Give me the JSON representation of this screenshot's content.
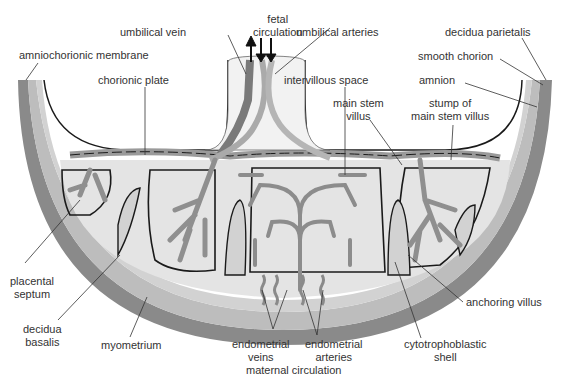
{
  "colors": {
    "myometrium": "#8a8a8a",
    "decidua": "#c4c4c4",
    "intervillous": "#e2e2e2",
    "vessel": "#9a9a9a",
    "outline": "#1a1a1a",
    "label": "#333333"
  },
  "labels": {
    "fetal_circulation_1": "fetal",
    "fetal_circulation_2": "circulation",
    "umbilical_vein": "umbilical vein",
    "umbilical_arteries": "umbilical arteries",
    "amniochorionic_membrane": "amniochorionic membrane",
    "decidua_parietalis": "decidua parietalis",
    "smooth_chorion": "smooth chorion",
    "chorionic_plate": "chorionic plate",
    "intervillous_space": "intervillous space",
    "amnion": "amnion",
    "main_stem_villus_1": "main stem",
    "main_stem_villus_2": "villus",
    "stump_1": "stump of",
    "stump_2": "main stem villus",
    "placental_septum_1": "placental",
    "placental_septum_2": "septum",
    "anchoring_villus": "anchoring villus",
    "decidua_basalis_1": "decidua",
    "decidua_basalis_2": "basalis",
    "myometrium": "myometrium",
    "endometrial_veins_1": "endometrial",
    "endometrial_veins_2": "veins",
    "endometrial_arteries_1": "endometrial",
    "endometrial_arteries_2": "arteries",
    "cytotrophoblastic_1": "cytotrophoblastic",
    "cytotrophoblastic_2": "shell",
    "maternal_circulation": "maternal circulation"
  }
}
